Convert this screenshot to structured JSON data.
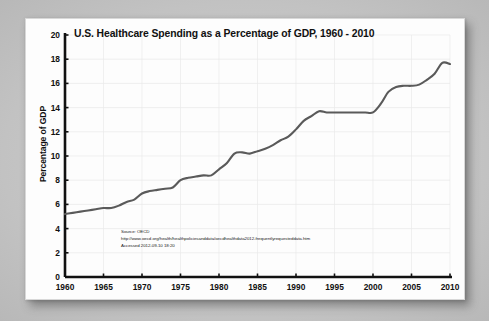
{
  "chart_data": {
    "type": "line",
    "title": "U.S. Healthcare Spending as a Percentage of GDP, 1960 - 2010",
    "xlabel": "",
    "ylabel": "Percentage of GDP",
    "xlim": [
      1960,
      2010
    ],
    "ylim": [
      0,
      20
    ],
    "xticks": [
      1960,
      1965,
      1970,
      1975,
      1980,
      1985,
      1990,
      1995,
      2000,
      2005,
      2010
    ],
    "yticks": [
      0,
      2,
      4,
      6,
      8,
      10,
      12,
      14,
      16,
      18,
      20
    ],
    "grid": true,
    "legend": null,
    "line_color": "#5a5a5a",
    "series": [
      {
        "name": "U.S. Healthcare Spending (% of GDP)",
        "x": [
          1960,
          1961,
          1962,
          1963,
          1964,
          1965,
          1966,
          1967,
          1968,
          1969,
          1970,
          1971,
          1972,
          1973,
          1974,
          1975,
          1976,
          1977,
          1978,
          1979,
          1980,
          1981,
          1982,
          1983,
          1984,
          1985,
          1986,
          1987,
          1988,
          1989,
          1990,
          1991,
          1992,
          1993,
          1994,
          1995,
          1996,
          1997,
          1998,
          1999,
          2000,
          2001,
          2002,
          2003,
          2004,
          2005,
          2006,
          2007,
          2008,
          2009,
          2010
        ],
        "values": [
          5.2,
          5.3,
          5.4,
          5.5,
          5.6,
          5.7,
          5.7,
          5.9,
          6.2,
          6.4,
          6.9,
          7.1,
          7.2,
          7.3,
          7.4,
          8.0,
          8.2,
          8.3,
          8.4,
          8.4,
          8.9,
          9.4,
          10.2,
          10.3,
          10.2,
          10.4,
          10.6,
          10.9,
          11.3,
          11.6,
          12.2,
          12.9,
          13.3,
          13.7,
          13.6,
          13.6,
          13.6,
          13.6,
          13.6,
          13.6,
          13.6,
          14.3,
          15.3,
          15.7,
          15.8,
          15.8,
          15.9,
          16.3,
          16.8,
          17.7,
          17.6
        ]
      }
    ],
    "annotations": {
      "source_lines": [
        "Source: OECD",
        "http://www.oecd.org/health/healthpoliciesanddata/oecdhealthdata2012-frequentlyrequesteddata.htm",
        "Accessed 2012-09-10 18:20"
      ]
    },
    "colors": {
      "background": "#c9c9c9",
      "panel": "#fdfdfd",
      "axis": "#111111",
      "grid": "#e9e9e9",
      "line": "#5a5a5a",
      "text": "#111111"
    }
  }
}
